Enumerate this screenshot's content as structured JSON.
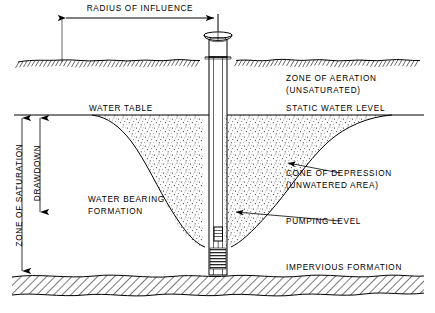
{
  "diagram": {
    "background_color": "#ffffff",
    "line_color": "#000000",
    "labels": {
      "radius_of_influence": "RADIUS OF INFLUENCE",
      "zone_of_aeration": "ZONE OF AERATION",
      "unsaturated": "(UNSATURATED)",
      "water_table": "WATER TABLE",
      "static_water_level": "STATIC WATER LEVEL",
      "cone_of_depression": "CONE OF DEPRESSION",
      "unwatered_area": "(UNWATERED AREA)",
      "water_bearing": "WATER BEARING",
      "formation": "FORMATION",
      "pumping_level": "PUMPING LEVEL",
      "impervious_formation": "IMPERVIOUS FORMATION",
      "zone_of_saturation": "ZONE OF SATURATION",
      "drawdown": "DRAWDOWN"
    }
  }
}
